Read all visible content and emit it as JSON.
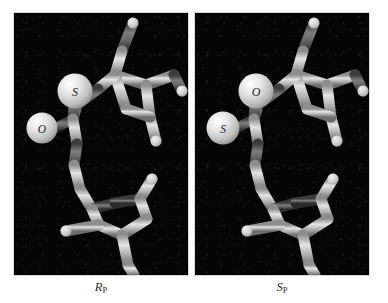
{
  "figure": {
    "background_color": "#ffffff",
    "panel_background_color": "#050505",
    "width": 388,
    "height": 303
  },
  "panels": [
    {
      "id": "left",
      "caption_stereo": "R",
      "caption_sub": "P",
      "caption_full": "Rp",
      "atom_labels": [
        {
          "name": "sulfur-sphere",
          "text": "S",
          "x": 75,
          "y": 92,
          "r": 17
        },
        {
          "name": "oxygen-sphere",
          "text": "O",
          "x": 37,
          "y": 128,
          "r": 15
        }
      ]
    },
    {
      "id": "right",
      "caption_stereo": "S",
      "caption_sub": "P",
      "caption_full": "Sp",
      "atom_labels": [
        {
          "name": "oxygen-sphere",
          "text": "O",
          "x": 75,
          "y": 92,
          "r": 17
        },
        {
          "name": "sulfur-sphere",
          "text": "S",
          "x": 37,
          "y": 128,
          "r": 15
        }
      ]
    }
  ],
  "colors": {
    "panel_background": "#050505",
    "stick_light": "#d9d9d9",
    "stick_mid": "#a8a8a8",
    "stick_dark": "#5d5d5d",
    "sphere_highlight": "#f2f2f2",
    "sphere_body": "#c9c9c9",
    "label_text": "#1a1a1a",
    "caption_text": "#2b2b2b",
    "panel_border": "#d8d8d8"
  },
  "render_style": {
    "representation": "ball-and-stick",
    "shading": "grayscale",
    "view": "3d-perspective"
  }
}
